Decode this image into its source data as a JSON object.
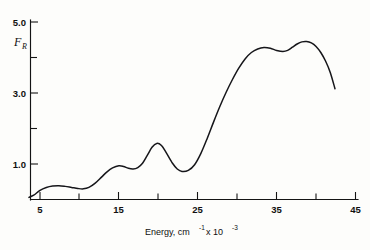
{
  "chart_data": {
    "type": "line",
    "title": "",
    "xlabel": "Energy, cm⁻¹ x 10⁻³",
    "xlabel_parts": {
      "lead": "Energy, cm",
      "sup1": "-1",
      "mid": " x 10",
      "sup2": "-3"
    },
    "ylabel": "F_R",
    "ylabel_parts": {
      "base": "F",
      "sub": "R"
    },
    "xlim": [
      2.5,
      45
    ],
    "ylim": [
      0.0,
      5.2
    ],
    "grid": false,
    "legend": null,
    "x_major_ticks": [
      5,
      15,
      25,
      35,
      45
    ],
    "x_major_tick_labels": [
      "5",
      "15",
      "25",
      "35",
      "45"
    ],
    "x_minor_ticks": [
      10,
      20,
      30,
      40
    ],
    "y_major_ticks": [
      1.0,
      3.0,
      5.0
    ],
    "y_major_tick_labels": [
      "1.0",
      "3.0",
      "5.0"
    ],
    "y_minor_ticks": [
      2.0,
      4.0
    ],
    "series": [
      {
        "name": "F_R spectrum",
        "color": "#16161a",
        "x": [
          3.6,
          4.2,
          5.0,
          5.8,
          6.6,
          7.4,
          8.2,
          9.0,
          9.8,
          10.5,
          11.2,
          12.0,
          12.8,
          13.5,
          14.2,
          15.0,
          15.6,
          16.2,
          16.8,
          17.4,
          18.0,
          18.6,
          19.2,
          19.8,
          20.4,
          21.0,
          21.8,
          22.4,
          23.0,
          23.8,
          24.6,
          25.4,
          26.2,
          27.0,
          27.8,
          28.6,
          29.4,
          30.2,
          31.0,
          31.8,
          32.6,
          33.4,
          34.2,
          35.0,
          35.8,
          36.4,
          37.0,
          37.6,
          38.2,
          38.8,
          39.4,
          40.0,
          40.6,
          41.2,
          41.8,
          42.4
        ],
        "y": [
          0.06,
          0.12,
          0.26,
          0.34,
          0.38,
          0.39,
          0.37,
          0.34,
          0.31,
          0.3,
          0.34,
          0.46,
          0.63,
          0.78,
          0.89,
          0.95,
          0.93,
          0.88,
          0.86,
          0.9,
          1.02,
          1.24,
          1.47,
          1.58,
          1.52,
          1.32,
          1.02,
          0.86,
          0.79,
          0.82,
          0.98,
          1.3,
          1.72,
          2.18,
          2.62,
          3.02,
          3.38,
          3.7,
          3.96,
          4.14,
          4.24,
          4.28,
          4.26,
          4.2,
          4.17,
          4.2,
          4.29,
          4.38,
          4.44,
          4.45,
          4.41,
          4.31,
          4.14,
          3.9,
          3.58,
          3.12
        ]
      }
    ]
  },
  "figure": {
    "background_color": "#fdfdfb",
    "curve_color": "#16161a",
    "axis_color": "#141414"
  }
}
